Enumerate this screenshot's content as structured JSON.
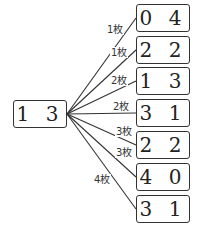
{
  "root": {
    "value": "1 3"
  },
  "branches": [
    {
      "value": "0 4",
      "label": "1枚"
    },
    {
      "value": "2 2",
      "label": "1枚"
    },
    {
      "value": "1 3",
      "label": "2枚"
    },
    {
      "value": "3 1",
      "label": "2枚"
    },
    {
      "value": "2 2",
      "label": "3枚"
    },
    {
      "value": "4 0",
      "label": "3枚"
    },
    {
      "value": "3 1",
      "label": "4枚"
    }
  ]
}
